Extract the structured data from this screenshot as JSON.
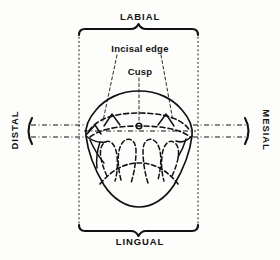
{
  "figure": {
    "title_labial": "LABIAL",
    "title_lingual": "LINGUAL",
    "title_distal": "DISTAL",
    "title_mesial": "MESIAL",
    "callout_incisal_edge": "Incisal edge",
    "callout_cusp": "Cusp",
    "ink_color": "#111111",
    "background_color": "#fdfdfc"
  },
  "annotations": {
    "labial_brace": "brace-up",
    "lingual_brace": "brace-down",
    "distal_bracket": "bracket-left",
    "mesial_bracket": "bracket-right",
    "horizontal_axis": "dash-dot-axis",
    "vertical_frame_left": "dash-dot-line",
    "vertical_frame_right": "dash-dot-line",
    "cusp_tip_marker": "small-circle"
  },
  "tooth": {
    "view": "occlusal",
    "outline": "solid-rounded-pentagon",
    "incisal_ridge": "dashed-arc",
    "cusp_count": 3,
    "lobe_count": 4
  }
}
